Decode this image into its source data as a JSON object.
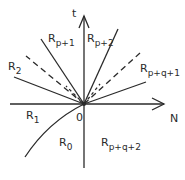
{
  "diagram": {
    "axes": {
      "vertical_label": "t",
      "horizontal_label": "N",
      "origin_label": "0"
    },
    "regions": [
      {
        "id": "R0",
        "base": "R",
        "sub": "0"
      },
      {
        "id": "R1",
        "base": "R",
        "sub": "1"
      },
      {
        "id": "R2",
        "base": "R",
        "sub": "2"
      },
      {
        "id": "Rp+1",
        "base": "R",
        "sub": "p+1"
      },
      {
        "id": "Rp+2",
        "base": "R",
        "sub": "p+2"
      },
      {
        "id": "Rp+q+1",
        "base": "R",
        "sub": "p+q+1"
      },
      {
        "id": "Rp+q+2",
        "base": "R",
        "sub": "p+q+2"
      }
    ],
    "colors": {
      "line": "#2a2a2a",
      "background": "#ffffff"
    }
  }
}
